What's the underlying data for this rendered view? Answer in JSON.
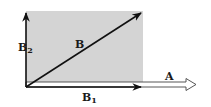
{
  "diagram": {
    "type": "vector-decomposition",
    "colors": {
      "background": "#ffffff",
      "rectangle_fill": "#d4d4d4",
      "vector_stroke": "#111111",
      "hollow_arrow_fill": "#ffffff"
    },
    "rectangle": {
      "x": 26,
      "y": 11,
      "width": 117,
      "height": 76
    },
    "vectors": [
      {
        "id": "B",
        "label": "B",
        "subscript": "",
        "from": [
          26,
          87
        ],
        "to": [
          142,
          12
        ],
        "style": "solid"
      },
      {
        "id": "B1",
        "label": "B",
        "subscript": "1",
        "from": [
          26,
          87
        ],
        "to": [
          142,
          87
        ],
        "style": "solid"
      },
      {
        "id": "B2",
        "label": "B",
        "subscript": "2",
        "from": [
          26,
          87
        ],
        "to": [
          26,
          12
        ],
        "style": "solid"
      },
      {
        "id": "A",
        "label": "A",
        "subscript": "",
        "from": [
          26,
          84
        ],
        "to": [
          196,
          84
        ],
        "style": "hollow"
      }
    ],
    "labels": {
      "B": {
        "text": "B",
        "sub": ""
      },
      "B1": {
        "text": "B",
        "sub": "1"
      },
      "B2": {
        "text": "B",
        "sub": "2"
      },
      "A": {
        "text": "A",
        "sub": ""
      }
    }
  }
}
